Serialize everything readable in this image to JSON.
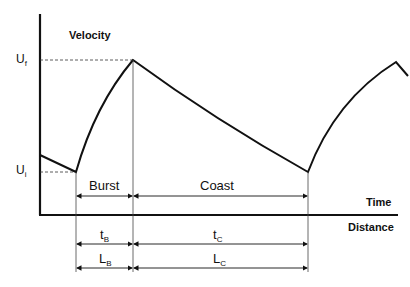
{
  "diagram": {
    "y_axis_label": "Velocity",
    "x_axis_label_top": "Time",
    "x_axis_label_bottom": "Distance",
    "levels": {
      "upper": {
        "symbol": "U",
        "sub": "f"
      },
      "lower": {
        "symbol": "U",
        "sub": "i"
      }
    },
    "phases": [
      {
        "name": "Burst",
        "time": {
          "symbol": "t",
          "sub": "B"
        },
        "length": {
          "symbol": "L",
          "sub": "B"
        }
      },
      {
        "name": "Coast",
        "time": {
          "symbol": "t",
          "sub": "C"
        },
        "length": {
          "symbol": "L",
          "sub": "C"
        }
      }
    ],
    "colors": {
      "line": "#111111",
      "background": "#ffffff"
    }
  }
}
